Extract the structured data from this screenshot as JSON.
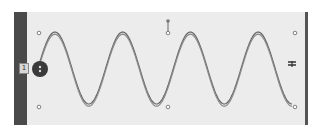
{
  "panel": {
    "background": "#ececec",
    "left_bar_color": "#4a4a4a",
    "right_bar_color": "#555555"
  },
  "tag": {
    "label": "1"
  },
  "wave": {
    "cycles": 3.75,
    "stroke": "#555555",
    "x_start": 38,
    "x_end": 292,
    "y_center": 68,
    "amplitude": 36
  },
  "handles": [
    {
      "name": "top-left",
      "x": 39,
      "y": 33
    },
    {
      "name": "bottom-left",
      "x": 39,
      "y": 107
    },
    {
      "name": "top-right",
      "x": 295,
      "y": 33
    },
    {
      "name": "bottom-right",
      "x": 295,
      "y": 107
    },
    {
      "name": "bottom-mid",
      "x": 168,
      "y": 107
    }
  ],
  "pin": {
    "x": 168,
    "y_top": 21,
    "y_bottom": 33
  },
  "start_knob": {
    "x": 40,
    "y": 69,
    "r": 8,
    "color": "#3a3a3a"
  },
  "end_glyph": {
    "x": 292,
    "y": 65
  }
}
